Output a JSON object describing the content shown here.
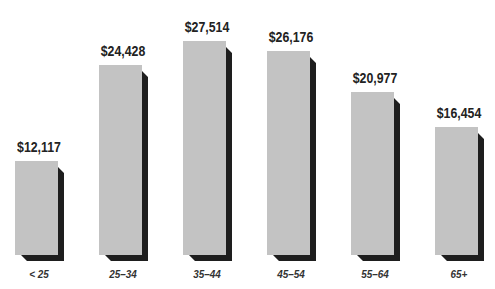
{
  "chart_data": {
    "type": "bar",
    "title": "",
    "xlabel": "",
    "ylabel": "",
    "categories": [
      "< 25",
      "25–34",
      "35–44",
      "45–54",
      "55–64",
      "65+"
    ],
    "values": [
      12117,
      24428,
      27514,
      26176,
      20977,
      16454
    ],
    "value_labels": [
      "$12,117",
      "$24,428",
      "$27,514",
      "$26,176",
      "$20,977",
      "$16,454"
    ],
    "ylim": [
      0,
      30000
    ],
    "grid": false,
    "legend": "none",
    "style": {
      "bar_color": "#c3c3c3",
      "shadow_color": "#1e1e1e",
      "three_d": true
    }
  }
}
